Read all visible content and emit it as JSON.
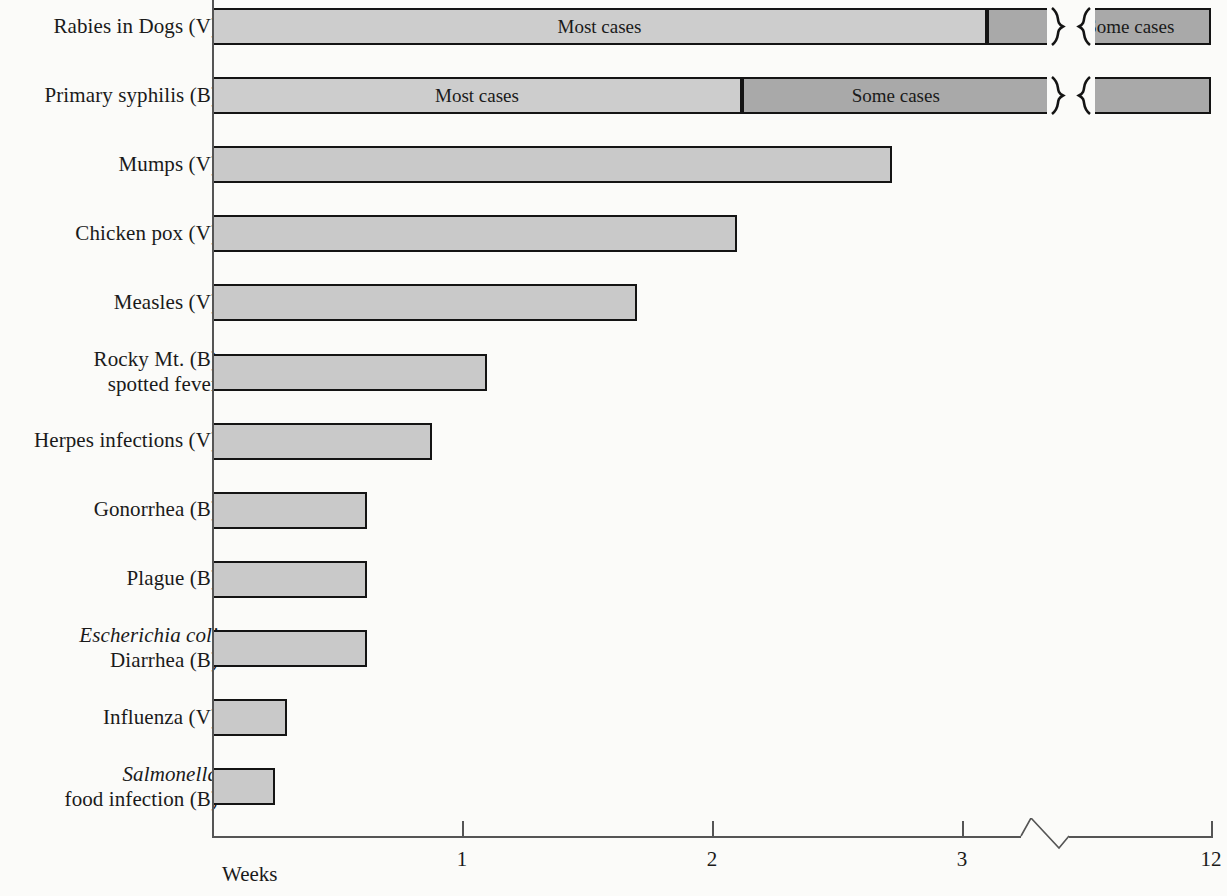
{
  "chart_data": {
    "type": "bar",
    "title": "",
    "xlabel": "Weeks",
    "ylabel": "",
    "orientation": "horizontal",
    "grid": false,
    "legend_position": "none",
    "axis_break": {
      "between": [
        3.35,
        11.3
      ],
      "style": "zigzag"
    },
    "xticks": [
      "1",
      "2",
      "3",
      "12"
    ],
    "xtick_values": [
      1,
      2,
      3,
      12
    ],
    "xlim": [
      0,
      12
    ],
    "categories": [
      "Rabies in Dogs (V)",
      "Primary syphilis (B)",
      "Mumps (V)",
      "Chicken pox (V)",
      "Measles (V)",
      "Rocky Mt. spotted fever (B)",
      "Herpes infections (V)",
      "Gonorrhea (B)",
      "Plague (B)",
      "Escherichia coli Diarrhea (B)",
      "Influenza (V)",
      "Salmonella food infection (B)"
    ],
    "values": [
      12,
      12,
      2.72,
      2.1,
      1.7,
      1.1,
      0.88,
      0.62,
      0.62,
      0.62,
      0.3,
      0.25
    ],
    "annotations": [
      "Most cases",
      "Some cases",
      "Most cases",
      "Some cases"
    ]
  },
  "axis": {
    "x_title": "Weeks",
    "ticks": [
      {
        "label": "1",
        "value": 1
      },
      {
        "label": "2",
        "value": 2
      },
      {
        "label": "3",
        "value": 3
      },
      {
        "label": "12",
        "value": 12
      }
    ]
  },
  "rows": [
    {
      "id": "rabies-in-dogs",
      "label_line1": "Rabies in Dogs (V)",
      "label_line2": "",
      "label_line1_italic": false,
      "value": 12,
      "segments": [
        {
          "label": "Most cases",
          "shade": "light",
          "end": 3.1
        },
        {
          "label": "",
          "shade": "dark",
          "end": 3.35
        },
        {
          "label": "Some cases",
          "shade": "dark",
          "end": 12
        }
      ]
    },
    {
      "id": "primary-syphilis",
      "label_line1": "Primary syphilis (B)",
      "label_line2": "",
      "label_line1_italic": false,
      "value": 12,
      "segments": [
        {
          "label": "Most cases",
          "shade": "light",
          "end": 2.12
        },
        {
          "label": "Some cases",
          "shade": "dark",
          "end": 3.35
        },
        {
          "label": "",
          "shade": "dark",
          "end": 12
        }
      ]
    },
    {
      "id": "mumps",
      "label_line1": "Mumps (V)",
      "label_line2": "",
      "label_line1_italic": false,
      "value": 2.72,
      "segments": [
        {
          "label": "",
          "shade": "plain",
          "end": 2.72
        }
      ]
    },
    {
      "id": "chicken-pox",
      "label_line1": "Chicken pox (V)",
      "label_line2": "",
      "label_line1_italic": false,
      "value": 2.1,
      "segments": [
        {
          "label": "",
          "shade": "plain",
          "end": 2.1
        }
      ]
    },
    {
      "id": "measles",
      "label_line1": "Measles (V)",
      "label_line2": "",
      "label_line1_italic": false,
      "value": 1.7,
      "segments": [
        {
          "label": "",
          "shade": "plain",
          "end": 1.7
        }
      ]
    },
    {
      "id": "rocky-mt-spotted-fever",
      "label_line1": "Rocky Mt. (B)",
      "label_line2": "spotted fever",
      "label_line1_italic": false,
      "value": 1.1,
      "segments": [
        {
          "label": "",
          "shade": "plain",
          "end": 1.1
        }
      ]
    },
    {
      "id": "herpes-infections",
      "label_line1": "Herpes infections (V)",
      "label_line2": "",
      "label_line1_italic": false,
      "value": 0.88,
      "segments": [
        {
          "label": "",
          "shade": "plain",
          "end": 0.88
        }
      ]
    },
    {
      "id": "gonorrhea",
      "label_line1": "Gonorrhea (B)",
      "label_line2": "",
      "label_line1_italic": false,
      "value": 0.62,
      "segments": [
        {
          "label": "",
          "shade": "plain",
          "end": 0.62
        }
      ]
    },
    {
      "id": "plague",
      "label_line1": "Plague (B)",
      "label_line2": "",
      "label_line1_italic": false,
      "value": 0.62,
      "segments": [
        {
          "label": "",
          "shade": "plain",
          "end": 0.62
        }
      ]
    },
    {
      "id": "escherichia-coli-diarrhea",
      "label_line1": "Escherichia coli",
      "label_line2": "Diarrhea (B)",
      "label_line1_italic": true,
      "value": 0.62,
      "segments": [
        {
          "label": "",
          "shade": "plain",
          "end": 0.62
        }
      ]
    },
    {
      "id": "influenza",
      "label_line1": "Influenza (V)",
      "label_line2": "",
      "label_line1_italic": false,
      "value": 0.3,
      "segments": [
        {
          "label": "",
          "shade": "plain",
          "end": 0.3
        }
      ]
    },
    {
      "id": "salmonella-food-infection",
      "label_line1": "Salmonella",
      "label_line2": "food infection (B)",
      "label_line1_italic": true,
      "value": 0.25,
      "segments": [
        {
          "label": "",
          "shade": "plain",
          "end": 0.25
        }
      ]
    }
  ]
}
